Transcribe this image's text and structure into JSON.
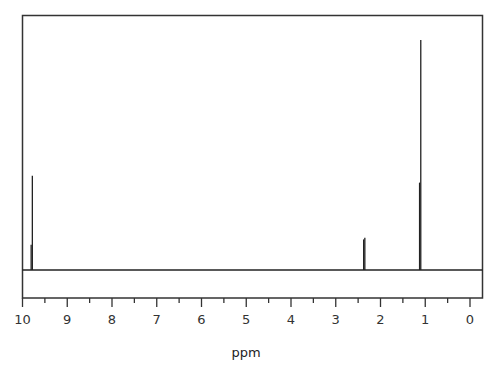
{
  "chart_data": {
    "type": "line",
    "title": "",
    "xlabel": "ppm",
    "ylabel": "",
    "xlim": [
      10,
      0
    ],
    "x_reversed": true,
    "grid": false,
    "legend": null,
    "major_ticks": [
      10,
      9,
      8,
      7,
      6,
      5,
      4,
      3,
      2,
      1,
      0
    ],
    "minor_ticks": [
      9.5,
      8.5,
      7.5,
      6.5,
      5.5,
      4.5,
      3.5,
      2.5,
      1.5,
      0.5
    ],
    "tick_labels": [
      "10",
      "9",
      "8",
      "7",
      "6",
      "5",
      "4",
      "3",
      "2",
      "1",
      "0"
    ],
    "peaks": [
      {
        "ppm": 9.78,
        "relative_height": 0.41,
        "shoulder_height": 0.11,
        "multiplicity": "triplet (narrow)"
      },
      {
        "ppm": 2.35,
        "relative_height": 0.14,
        "multiplicity": "multiplet"
      },
      {
        "ppm": 1.1,
        "relative_height": 1.0,
        "shoulder_height": 0.38,
        "multiplicity": "triplet"
      }
    ],
    "baseline": 0
  },
  "colors": {
    "line": "#222222",
    "frame": "#333333",
    "background": "#ffffff"
  }
}
